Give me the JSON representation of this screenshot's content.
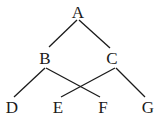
{
  "nodes": {
    "A": {
      "label": "A",
      "x": 78,
      "y": 12
    },
    "B": {
      "label": "B",
      "x": 45,
      "y": 58
    },
    "C": {
      "label": "C",
      "x": 112,
      "y": 58
    },
    "D": {
      "label": "D",
      "x": 12,
      "y": 107
    },
    "E": {
      "label": "E",
      "x": 58,
      "y": 107
    },
    "F": {
      "label": "F",
      "x": 103,
      "y": 107
    },
    "G": {
      "label": "G",
      "x": 148,
      "y": 107
    }
  },
  "edges": [
    {
      "from": "A",
      "to": "B"
    },
    {
      "from": "A",
      "to": "C"
    },
    {
      "from": "B",
      "to": "D"
    },
    {
      "from": "B",
      "to": "F"
    },
    {
      "from": "C",
      "to": "E"
    },
    {
      "from": "C",
      "to": "G"
    }
  ],
  "colors": {
    "line": "#1a1a1a",
    "text": "#1a1a1a",
    "background": "#ffffff"
  }
}
